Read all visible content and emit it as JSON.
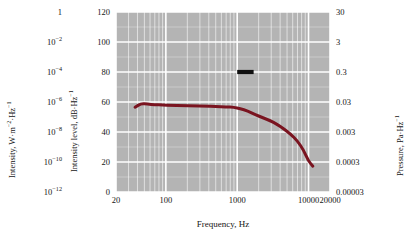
{
  "chart_data": {
    "type": "line",
    "title": "",
    "xlabel": "Frequency, Hz",
    "xscale": "log",
    "xlim": [
      20,
      20000
    ],
    "xticks": [
      20,
      100,
      1000,
      10000,
      20000
    ],
    "xticklabels": [
      "20",
      "100",
      "1000",
      "10000",
      "20000"
    ],
    "ylabel": "Intensity level, dB·Hz⁻¹",
    "ylim": [
      0,
      120
    ],
    "yticks": [
      0,
      20,
      40,
      60,
      80,
      100,
      120
    ],
    "yticklabels": [
      "0",
      "20",
      "40",
      "60",
      "80",
      "100",
      "120"
    ],
    "grid": true,
    "legend": "none",
    "plot_background": "#b4b4b4",
    "gridline_color": "#ffffff",
    "series": [
      {
        "name": "spectrum",
        "color": "#7a1420",
        "linewidth": 3,
        "x": [
          37,
          45,
          55,
          70,
          90,
          120,
          170,
          250,
          350,
          500,
          700,
          900,
          1100,
          1400,
          1800,
          2300,
          2900,
          3600,
          4500,
          5600,
          7000,
          8500,
          10000,
          11500
        ],
        "y": [
          56.5,
          59.0,
          58.6,
          58.2,
          58.0,
          57.8,
          57.6,
          57.4,
          57.2,
          57.0,
          56.8,
          56.4,
          55.6,
          54.0,
          51.6,
          49.4,
          47.6,
          45.2,
          42.0,
          38.6,
          34.0,
          28.0,
          20.6,
          17.2
        ]
      }
    ],
    "annotations": [
      {
        "name": "reference-bar",
        "type": "horizontal-bar",
        "color": "#101010",
        "x_start": 1000,
        "x_end": 1700,
        "y": 80,
        "label": ""
      }
    ],
    "secondary_axes": [
      {
        "position": "left-outer",
        "label": "Intensity, W·m⁻²·Hz⁻¹",
        "ticks": [
          {
            "value": 120,
            "text_base": "1",
            "text_exp": ""
          },
          {
            "value": 100,
            "text_base": "10",
            "text_exp": "−2"
          },
          {
            "value": 80,
            "text_base": "10",
            "text_exp": "−4"
          },
          {
            "value": 60,
            "text_base": "10",
            "text_exp": "−6"
          },
          {
            "value": 40,
            "text_base": "10",
            "text_exp": "−8"
          },
          {
            "value": 20,
            "text_base": "10",
            "text_exp": "−10"
          },
          {
            "value": 0,
            "text_base": "10",
            "text_exp": "−12"
          }
        ]
      },
      {
        "position": "right",
        "label": "Pressure, Pa·Hz⁻¹",
        "ticks": [
          {
            "value": 120,
            "text": "30"
          },
          {
            "value": 100,
            "text": "3"
          },
          {
            "value": 80,
            "text": "0.3"
          },
          {
            "value": 60,
            "text": "0.03"
          },
          {
            "value": 40,
            "text": "0.003"
          },
          {
            "value": 20,
            "text": "0.0003"
          },
          {
            "value": 0,
            "text": "0.00003"
          }
        ]
      }
    ]
  },
  "axes": {
    "intensity": {
      "title_base": "Intensity, W·m",
      "title_exp1": "−2",
      "title_mid": "·Hz",
      "title_exp2": "−1"
    },
    "db": {
      "title_base": "Intensity level, dB·Hz",
      "title_exp": "−1"
    },
    "pressure": {
      "title_base": "Pressure, Pa·Hz",
      "title_exp": "−1"
    },
    "x": {
      "title": "Frequency, Hz"
    }
  }
}
